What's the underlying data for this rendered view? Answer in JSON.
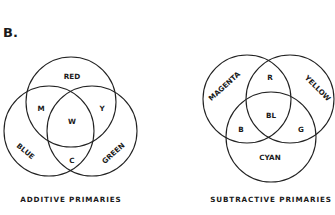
{
  "figure_label": "B.",
  "additive": {
    "caption": "ADDITIVE PRIMARIES",
    "circles": {
      "top": "RED",
      "left": "BLUE",
      "right": "GREEN"
    },
    "overlaps": {
      "red_blue": "M",
      "red_green": "Y",
      "blue_green": "C",
      "center": "W"
    }
  },
  "subtractive": {
    "caption": "SUBTRACTIVE PRIMARIES",
    "circles": {
      "left": "MAGENTA",
      "right": "YELLOW",
      "bottom": "CYAN"
    },
    "overlaps": {
      "magenta_yellow": "R",
      "magenta_cyan": "B",
      "yellow_cyan": "G",
      "center": "BL"
    }
  },
  "colors": {
    "stroke": "#222222",
    "text": "#1a1a1a",
    "background": "#ffffff"
  }
}
